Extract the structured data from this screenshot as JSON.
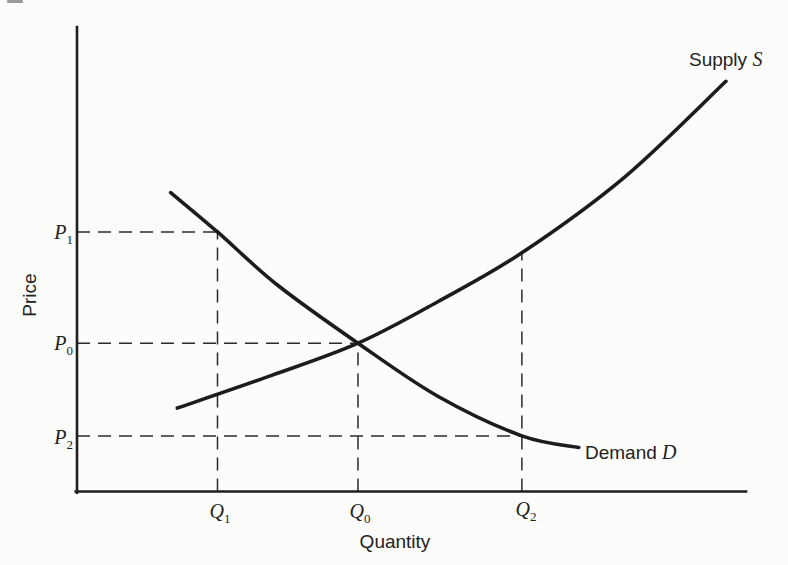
{
  "labels": {
    "y_axis": "Price",
    "x_axis": "Quantity",
    "supply": {
      "word": "Supply",
      "symbol": "S"
    },
    "demand": {
      "word": "Demand",
      "symbol": "D"
    },
    "price_levels": [
      {
        "base": "P",
        "sub": "1"
      },
      {
        "base": "P",
        "sub": "0"
      },
      {
        "base": "P",
        "sub": "2"
      }
    ],
    "quantity_levels": [
      {
        "base": "Q",
        "sub": "1"
      },
      {
        "base": "Q",
        "sub": "0"
      },
      {
        "base": "Q",
        "sub": "2"
      }
    ]
  },
  "chart_data": {
    "type": "line",
    "title": "",
    "xlabel": "Quantity",
    "ylabel": "Price",
    "xlim": [
      0,
      10
    ],
    "ylim": [
      0,
      10
    ],
    "axes_numeric": false,
    "grid": false,
    "legend": "inline-curve-labels",
    "series": [
      {
        "name": "Supply S",
        "shape": "convex-increasing",
        "points": [
          [
            1.5,
            1.8
          ],
          [
            2.9,
            2.5
          ],
          [
            4.2,
            3.2
          ],
          [
            5.4,
            4.1
          ],
          [
            6.65,
            5.15
          ],
          [
            8.2,
            6.8
          ],
          [
            9.7,
            8.85
          ]
        ]
      },
      {
        "name": "Demand D",
        "shape": "convex-decreasing",
        "points": [
          [
            1.4,
            6.45
          ],
          [
            2.1,
            5.6
          ],
          [
            3.0,
            4.45
          ],
          [
            4.2,
            3.2
          ],
          [
            5.4,
            2.05
          ],
          [
            6.65,
            1.2
          ],
          [
            7.5,
            0.95
          ]
        ]
      }
    ],
    "equilibrium": {
      "quantity_label": "Q0",
      "price_label": "P0",
      "point": [
        4.2,
        3.2
      ]
    },
    "reference_levels": {
      "P1": 5.6,
      "P0": 3.2,
      "P2": 1.2,
      "Q1": 2.1,
      "Q0": 4.2,
      "Q2": 6.65
    },
    "guides": [
      {
        "name": "P1-dash",
        "dir": "h",
        "level": 5.6,
        "from": 0,
        "to": 2.1
      },
      {
        "name": "Q1-dash",
        "dir": "v",
        "level": 2.1,
        "from": 0,
        "to": 5.6
      },
      {
        "name": "P0-dash",
        "dir": "h",
        "level": 3.2,
        "from": 0,
        "to": 4.2
      },
      {
        "name": "Q0-dash",
        "dir": "v",
        "level": 4.2,
        "from": 0,
        "to": 3.2
      },
      {
        "name": "P2-dash",
        "dir": "h",
        "level": 1.2,
        "from": 0,
        "to": 6.65
      },
      {
        "name": "Q2-dash",
        "dir": "v",
        "level": 6.65,
        "from": 0,
        "to": 5.15
      }
    ],
    "colors": {
      "ink": "#1f1f1f",
      "background": "#fcfcfa"
    }
  }
}
